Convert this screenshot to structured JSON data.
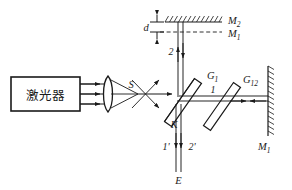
{
  "figure": {
    "stroke_color": "#1a1a1a",
    "background_color": "#ffffff"
  },
  "source": {
    "box_label": "激光器",
    "box_name": "laser-source"
  },
  "labels": {
    "focus_point": "S",
    "spacing": "d",
    "mirror_top": "M",
    "mirror_top_sub": "2",
    "mirror_virtual": "M",
    "mirror_virtual_sub": "1",
    "mirror_right": "M",
    "mirror_right_sub": "1",
    "splitter": "G",
    "splitter_sub": "1",
    "compensator": "G",
    "compensator_sub": "12",
    "coating": "K",
    "beam_vertical": "2",
    "beam_horizontal": "1",
    "beam_out_left": "1'",
    "beam_out_right": "2'",
    "observer": "E"
  }
}
